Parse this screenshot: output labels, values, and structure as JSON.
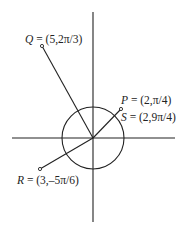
{
  "diagram": {
    "type": "polar-coordinates",
    "colors": {
      "stroke": "#222222",
      "background": "#ffffff"
    },
    "origin": {
      "x": 93,
      "y": 138
    },
    "circle_radius_units": 2,
    "points": [
      {
        "name": "P",
        "r": 2,
        "theta": "π/4",
        "label_value": "(2,π/4)"
      },
      {
        "name": "S",
        "r": 2,
        "theta": "9π/4",
        "label_value": "(2,9π/4)"
      },
      {
        "name": "Q",
        "r": 5,
        "theta": "2π/3",
        "label_value": "(5,2π/3)"
      },
      {
        "name": "R",
        "r": 3,
        "theta": "-5π/6",
        "label_value": "(3,–5π/6)"
      }
    ],
    "labels": {
      "P": {
        "name": "P",
        "eq": " = (2,π/4)"
      },
      "S": {
        "name": "S",
        "eq": " = (2,9π/4)"
      },
      "Q": {
        "name": "Q",
        "eq": " = (5,2π/3)"
      },
      "R": {
        "name": "R",
        "eq": " = (3,–5π/6)"
      }
    }
  }
}
